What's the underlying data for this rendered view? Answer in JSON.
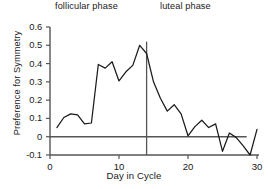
{
  "chart_data": {
    "type": "line",
    "title": "",
    "xlabel": "Day in Cycle",
    "ylabel": "Preference for Symmetry",
    "xlim": [
      0,
      30
    ],
    "ylim": [
      -0.1,
      0.6
    ],
    "grid": false,
    "legend": null,
    "xticks": [
      0,
      10,
      20,
      30
    ],
    "xtick_labels": [
      "0",
      "10",
      "20",
      "30"
    ],
    "yticks": [
      -0.1,
      0,
      0.1,
      0.2,
      0.3,
      0.4,
      0.5,
      0.6
    ],
    "ytick_labels": [
      "-0.1",
      "0",
      "0.1",
      "0.2",
      "0.3",
      "0.4",
      "0.5",
      "0.6"
    ],
    "x": [
      1,
      2,
      3,
      4,
      5,
      6,
      7,
      8,
      9,
      10,
      11,
      12,
      13,
      14,
      15,
      16,
      17,
      18,
      19,
      20,
      21,
      22,
      23,
      24,
      25,
      26,
      27,
      28,
      29,
      30
    ],
    "values": [
      0.05,
      0.105,
      0.125,
      0.12,
      0.07,
      0.075,
      0.395,
      0.375,
      0.41,
      0.305,
      0.355,
      0.39,
      0.5,
      0.455,
      0.3,
      0.21,
      0.14,
      0.175,
      0.125,
      0.005,
      0.055,
      0.09,
      0.05,
      0.07,
      -0.08,
      0.02,
      -0.005,
      -0.05,
      -0.1,
      0.04
    ],
    "series_name": "Preference for Symmetry",
    "line_color": "#1a1a1a",
    "zero_line": {
      "y": 0,
      "x_start": 0,
      "x_end": 28.5,
      "color": "#555555"
    },
    "phase_divider": {
      "x": 14,
      "y_start": -0.1,
      "y_end": 0.52,
      "color": "#555555"
    },
    "annotations": [
      {
        "name": "follicular-phase-label",
        "text": "follicular phase",
        "x": 6
      },
      {
        "name": "luteal-phase-label",
        "text": "luteal  phase",
        "x": 21
      }
    ]
  },
  "axes": {
    "x_title": "Day in Cycle",
    "y_title": "Preference for Symmetry"
  }
}
